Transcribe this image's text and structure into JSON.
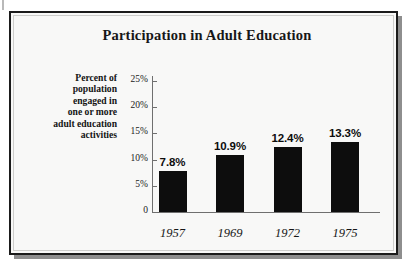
{
  "figure": {
    "title": "Participation in Adult Education",
    "axis_caption_lines": [
      "Percent of",
      "population",
      "engaged in",
      "one or more",
      "adult education",
      "activities"
    ]
  },
  "chart_data": {
    "type": "bar",
    "title": "Participation in Adult Education",
    "xlabel": "",
    "ylabel": "Percent of population engaged in one or more adult education activities",
    "categories": [
      "1957",
      "1969",
      "1972",
      "1975"
    ],
    "values": [
      7.8,
      10.9,
      12.4,
      13.3
    ],
    "value_labels": [
      "7.8%",
      "10.9%",
      "12.4%",
      "13.3%"
    ],
    "ylim": [
      0,
      25
    ],
    "ytick_labels": [
      "25%",
      "20%",
      "15%",
      "10%",
      "5%",
      "0"
    ],
    "ytick_values": [
      25,
      20,
      15,
      10,
      5,
      0
    ],
    "grid": false,
    "legend": "none",
    "bar_color": "#0d0d0d",
    "background_color": "#f8f8f7",
    "axis_color": "#6f6f6f"
  }
}
